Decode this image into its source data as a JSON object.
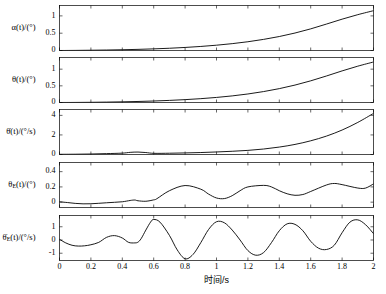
{
  "figure": {
    "xlabel": "时间/s",
    "x_ticks": [
      "0",
      "0.2",
      "0.4",
      "0.6",
      "0.8",
      "1",
      "1.2",
      "1.4",
      "1.6",
      "1.8",
      "2"
    ],
    "x_tick_values": [
      0,
      0.2,
      0.4,
      0.6,
      0.8,
      1,
      1.2,
      1.4,
      1.6,
      1.8,
      2
    ],
    "xlim": [
      0,
      2
    ],
    "line_color": "#000000",
    "background": "#ffffff"
  },
  "chart_data": {
    "type": "line",
    "title": "",
    "xlabel": "时间/s",
    "xlim": [
      0,
      2
    ],
    "grid": false,
    "legend": "none",
    "panels": [
      {
        "id": "panel-alpha",
        "ylabel_main": "α(t)/(°)",
        "ylabel_parts": {
          "sym": "α",
          "arg": "(t)",
          "unit": "/(°)"
        },
        "ylim": [
          0,
          1.3
        ],
        "y_ticks": [
          "0",
          "0.5",
          "1"
        ],
        "y_tick_values": [
          0,
          0.5,
          1
        ],
        "x": [
          0,
          0.1,
          0.2,
          0.3,
          0.4,
          0.5,
          0.6,
          0.7,
          0.8,
          0.9,
          1.0,
          1.1,
          1.2,
          1.3,
          1.4,
          1.5,
          1.6,
          1.7,
          1.8,
          1.9,
          2.0
        ],
        "y": [
          0.0,
          0.003,
          0.008,
          0.014,
          0.022,
          0.033,
          0.047,
          0.065,
          0.088,
          0.117,
          0.153,
          0.198,
          0.253,
          0.321,
          0.404,
          0.505,
          0.625,
          0.763,
          0.905,
          1.035,
          1.15
        ]
      },
      {
        "id": "panel-theta",
        "ylabel_main": "θ(t)/(°)",
        "ylabel_parts": {
          "sym": "θ",
          "arg": "(t)",
          "unit": "/(°)"
        },
        "ylim": [
          0,
          1.35
        ],
        "y_ticks": [
          "0",
          "0.5",
          "1"
        ],
        "y_tick_values": [
          0,
          0.5,
          1
        ],
        "x": [
          0,
          0.1,
          0.2,
          0.3,
          0.4,
          0.5,
          0.6,
          0.7,
          0.8,
          0.9,
          1.0,
          1.1,
          1.2,
          1.3,
          1.4,
          1.5,
          1.6,
          1.7,
          1.8,
          1.9,
          2.0
        ],
        "y": [
          0.0,
          0.002,
          0.006,
          0.012,
          0.02,
          0.031,
          0.045,
          0.063,
          0.086,
          0.115,
          0.152,
          0.198,
          0.256,
          0.328,
          0.416,
          0.523,
          0.65,
          0.795,
          0.948,
          1.09,
          1.215
        ]
      },
      {
        "id": "panel-theta-dot",
        "ylabel_main": "θ̇(t)/(°/s)",
        "ylabel_parts": {
          "sym": "θ",
          "arg": "(t)",
          "unit": "/(°/s)",
          "dot": true
        },
        "ylim": [
          0,
          4.6
        ],
        "y_ticks": [
          "0",
          "2",
          "4"
        ],
        "y_tick_values": [
          0,
          2,
          4
        ],
        "x": [
          0,
          0.1,
          0.2,
          0.3,
          0.4,
          0.45,
          0.5,
          0.55,
          0.6,
          0.7,
          0.8,
          0.9,
          1.0,
          1.1,
          1.2,
          1.3,
          1.4,
          1.5,
          1.6,
          1.7,
          1.8,
          1.9,
          2.0
        ],
        "y": [
          0.02,
          0.03,
          0.05,
          0.09,
          0.14,
          0.22,
          0.25,
          0.2,
          0.12,
          0.13,
          0.16,
          0.2,
          0.26,
          0.33,
          0.42,
          0.56,
          0.76,
          1.03,
          1.4,
          1.88,
          2.5,
          3.28,
          4.2
        ]
      },
      {
        "id": "panel-theta-e",
        "ylabel_main": "θ_E(t)/(°)",
        "ylabel_parts": {
          "sym": "θ",
          "sub": "E",
          "arg": "(t)",
          "unit": "/(°)"
        },
        "ylim": [
          -0.07,
          0.52
        ],
        "y_ticks": [
          "0",
          "0.2",
          "0.4"
        ],
        "y_tick_values": [
          0,
          0.2,
          0.4
        ],
        "x": [
          0,
          0.05,
          0.1,
          0.15,
          0.2,
          0.25,
          0.3,
          0.35,
          0.4,
          0.45,
          0.48,
          0.5,
          0.55,
          0.6,
          0.62,
          0.7,
          0.8,
          0.9,
          0.95,
          1.0,
          1.05,
          1.1,
          1.15,
          1.2,
          1.3,
          1.35,
          1.4,
          1.45,
          1.5,
          1.55,
          1.6,
          1.7,
          1.75,
          1.8,
          1.9,
          1.95,
          2.0
        ],
        "y": [
          0.005,
          -0.005,
          -0.016,
          -0.022,
          -0.021,
          -0.015,
          -0.008,
          -0.002,
          0.005,
          0.022,
          0.028,
          0.018,
          0.012,
          0.03,
          0.045,
          0.15,
          0.218,
          0.17,
          0.105,
          0.055,
          0.047,
          0.085,
          0.15,
          0.2,
          0.22,
          0.2,
          0.15,
          0.11,
          0.09,
          0.1,
          0.14,
          0.225,
          0.245,
          0.23,
          0.185,
          0.185,
          0.24
        ]
      },
      {
        "id": "panel-theta-e-dot",
        "ylabel_main": "θ̇_E(t)/(°/s)",
        "ylabel_parts": {
          "sym": "θ",
          "sub": "E",
          "arg": "(t)",
          "unit": "/(°/s)",
          "dot": true
        },
        "ylim": [
          -1.55,
          1.85
        ],
        "y_ticks": [
          "-1",
          "0",
          "1"
        ],
        "y_tick_values": [
          -1,
          0,
          1
        ],
        "x": [
          0,
          0.04,
          0.08,
          0.12,
          0.16,
          0.2,
          0.25,
          0.3,
          0.35,
          0.4,
          0.44,
          0.48,
          0.5,
          0.52,
          0.55,
          0.58,
          0.6,
          0.64,
          0.7,
          0.75,
          0.8,
          0.85,
          0.9,
          0.95,
          1.0,
          1.05,
          1.1,
          1.15,
          1.2,
          1.25,
          1.3,
          1.35,
          1.4,
          1.45,
          1.5,
          1.55,
          1.6,
          1.65,
          1.7,
          1.75,
          1.8,
          1.85,
          1.9,
          1.95,
          2.0
        ],
        "y": [
          0.05,
          -0.22,
          -0.4,
          -0.46,
          -0.44,
          -0.36,
          -0.18,
          0.2,
          0.33,
          0.15,
          -0.18,
          -0.22,
          -0.16,
          0.1,
          0.75,
          1.35,
          1.55,
          1.35,
          0.35,
          -0.75,
          -1.42,
          -1.1,
          -0.2,
          0.8,
          1.38,
          1.3,
          0.75,
          0.0,
          -0.8,
          -1.15,
          -0.95,
          -0.2,
          0.7,
          1.22,
          1.18,
          0.7,
          -0.1,
          -0.62,
          -0.72,
          -0.4,
          0.55,
          1.35,
          1.52,
          1.15,
          0.48
        ]
      }
    ]
  }
}
